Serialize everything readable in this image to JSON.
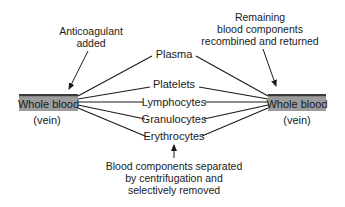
{
  "diagram": {
    "colors": {
      "line": "#1a1a1a",
      "box_fill": "#9c9c9c",
      "box_top_border": "#3a3a3a",
      "background": "#ffffff"
    },
    "left_node": {
      "label": "Whole blood",
      "sublabel": "(vein)"
    },
    "right_node": {
      "label": "Whole blood",
      "sublabel": "(vein)"
    },
    "components": [
      {
        "label": "Plasma"
      },
      {
        "label": "Platelets"
      },
      {
        "label": "Lymphocytes"
      },
      {
        "label": "Granulocytes"
      },
      {
        "label": "Erythrocytes"
      }
    ],
    "annotations": {
      "left_top": {
        "lines": [
          "Anticoagulant",
          "added"
        ]
      },
      "right_top": {
        "lines": [
          "Remaining",
          "blood components",
          "recombined and returned"
        ]
      },
      "bottom": {
        "lines": [
          "Blood components separated",
          "by centrifugation and",
          "selectively removed"
        ]
      }
    }
  }
}
